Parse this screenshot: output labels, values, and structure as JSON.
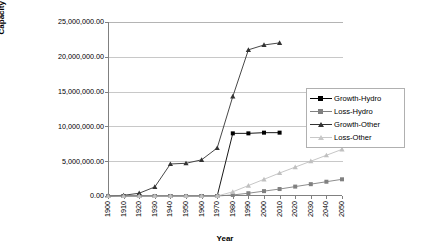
{
  "chart_data": {
    "type": "line",
    "title": "",
    "xlabel": "Year",
    "ylabel": "Capacity (1000m3)",
    "ylabel_base": "Capacity (1000m",
    "ylabel_sup": "3",
    "ylabel_close": ")",
    "x": [
      1900,
      1910,
      1920,
      1930,
      1940,
      1950,
      1960,
      1970,
      1980,
      1990,
      2000,
      2010,
      2020,
      2030,
      2040,
      2050
    ],
    "xlim": [
      1900,
      2050
    ],
    "ylim": [
      0,
      25000000
    ],
    "grid": true,
    "legend_position": "right",
    "ytick_labels": [
      "0.00",
      "5,000,000.00",
      "10,000,000.00",
      "15,000,000.00",
      "20,000,000.00",
      "25,000,000.00"
    ],
    "ytick_values": [
      0,
      5000000,
      10000000,
      15000000,
      20000000,
      25000000
    ],
    "xtick_labels": [
      "1900",
      "1910",
      "1920",
      "1930",
      "1940",
      "1950",
      "1960",
      "1970",
      "1980",
      "1990",
      "2000",
      "2010",
      "2020",
      "2030",
      "2040",
      "2050"
    ],
    "series": [
      {
        "name": "Growth-Hydro",
        "color": "#000000",
        "marker": "square",
        "x": [
          1900,
          1910,
          1920,
          1930,
          1940,
          1950,
          1960,
          1970,
          1980,
          1990,
          2000,
          2010
        ],
        "values": [
          0,
          0,
          0,
          0,
          0,
          0,
          0,
          0,
          9000000,
          9000000,
          9100000,
          9100000
        ]
      },
      {
        "name": "Loss-Hydro",
        "color": "#808080",
        "marker": "square",
        "x": [
          1900,
          1910,
          1920,
          1930,
          1940,
          1950,
          1960,
          1970,
          1980,
          1990,
          2000,
          2010,
          2020,
          2030,
          2040,
          2050
        ],
        "values": [
          0,
          0,
          0,
          0,
          0,
          0,
          0,
          0,
          150000,
          400000,
          700000,
          1000000,
          1350000,
          1700000,
          2050000,
          2400000
        ]
      },
      {
        "name": "Growth-Other",
        "color": "#333333",
        "marker": "triangle",
        "x": [
          1900,
          1910,
          1920,
          1930,
          1940,
          1950,
          1960,
          1970,
          1980,
          1990,
          2000,
          2010
        ],
        "values": [
          0,
          100000,
          400000,
          1300000,
          4600000,
          4700000,
          5200000,
          6900000,
          14300000,
          21000000,
          21700000,
          22000000
        ]
      },
      {
        "name": "Loss-Other",
        "color": "#c0c0c0",
        "marker": "triangle",
        "x": [
          1900,
          1910,
          1920,
          1930,
          1940,
          1950,
          1960,
          1970,
          1980,
          1990,
          2000,
          2010,
          2020,
          2030,
          2040,
          2050
        ],
        "values": [
          0,
          0,
          0,
          0,
          0,
          0,
          0,
          0,
          600000,
          1500000,
          2400000,
          3300000,
          4150000,
          5000000,
          5850000,
          6700000
        ]
      }
    ]
  },
  "legend": {
    "items": [
      {
        "label": "Growth-Hydro"
      },
      {
        "label": "Loss-Hydro"
      },
      {
        "label": "Growth-Other"
      },
      {
        "label": "Loss-Other"
      }
    ]
  }
}
